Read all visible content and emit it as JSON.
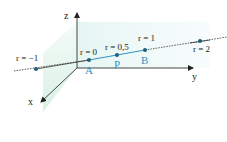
{
  "diagram": {
    "axes": {
      "x_label": "x",
      "y_label": "y",
      "z_label": "z"
    },
    "line": {
      "description": "Line through A and B, parameter r",
      "points": [
        {
          "id": "r-1",
          "name": "",
          "param_label": "r = −1",
          "r": -1
        },
        {
          "id": "A",
          "name": "A",
          "param_label": "r = 0",
          "r": 0
        },
        {
          "id": "P",
          "name": "P",
          "param_label": "r = 0,5",
          "r": 0.5
        },
        {
          "id": "B",
          "name": "B",
          "param_label": "r = 1",
          "r": 1
        },
        {
          "id": "r2",
          "name": "",
          "param_label": "r = 2",
          "r": 2
        }
      ]
    },
    "colors": {
      "segment": "#2f93c4",
      "point": "#1f5f7a",
      "dotted_line": "#333333",
      "axis": "#333333",
      "plane_tint": "#e4f5f2",
      "point_label": "#2f93c4",
      "text": "#222222"
    }
  }
}
